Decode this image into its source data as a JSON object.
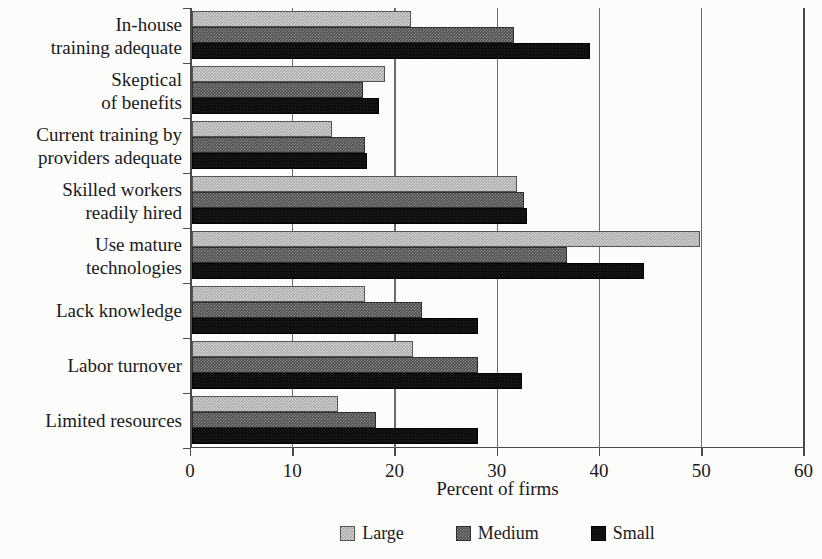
{
  "chart_data": {
    "type": "bar",
    "orientation": "horizontal",
    "title": "",
    "xlabel": "Percent of firms",
    "ylabel": "",
    "xlim": [
      0,
      60
    ],
    "xticks": [
      0,
      10,
      20,
      30,
      40,
      50,
      60
    ],
    "xticklabels": [
      "0",
      "10",
      "20",
      "30",
      "40",
      "50",
      "60"
    ],
    "grid": "vertical",
    "legend_position": "bottom-center",
    "categories": [
      "In-house\ntraining adequate",
      "Skeptical\nof benefits",
      "Current training by\nproviders adequate",
      "Skilled workers\nreadily hired",
      "Use mature\ntechnologies",
      "Lack knowledge",
      "Labor turnover",
      "Limited resources"
    ],
    "series": [
      {
        "name": "Large",
        "color": "#a9a9a9",
        "values": [
          21.5,
          18.9,
          13.7,
          31.8,
          49.7,
          17.0,
          21.7,
          14.3
        ]
      },
      {
        "name": "Medium",
        "color": "#4d4d4d",
        "values": [
          31.5,
          16.8,
          17.0,
          32.5,
          36.7,
          22.5,
          28.0,
          18.0
        ]
      },
      {
        "name": "Small",
        "color": "#0d0d0d",
        "values": [
          39.0,
          18.3,
          17.2,
          32.8,
          44.3,
          28.0,
          32.3,
          28.0
        ]
      }
    ]
  },
  "legend": {
    "items": [
      {
        "label": "Large",
        "swatch": "legend-swatch-large"
      },
      {
        "label": "Medium",
        "swatch": "legend-swatch-medium"
      },
      {
        "label": "Small",
        "swatch": "legend-swatch-small"
      }
    ]
  }
}
